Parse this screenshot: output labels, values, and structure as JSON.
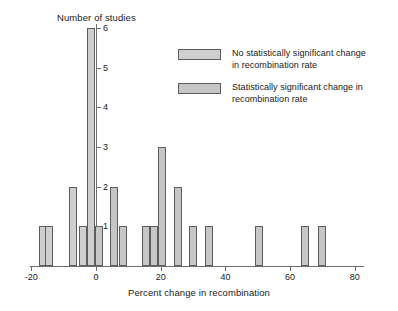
{
  "chart_data": {
    "type": "bar",
    "title": "",
    "xlabel": "Percent change in recombination",
    "ylabel": "Number of studies",
    "xlim": [
      -22,
      82
    ],
    "ylim": [
      0,
      6
    ],
    "grid": false,
    "legend_position": "upper-right",
    "xticks": [
      -20,
      0,
      20,
      40,
      60,
      80
    ],
    "xticklabels": [
      "-20",
      "0",
      "20",
      "40",
      "60",
      "80"
    ],
    "yticks": [
      1,
      2,
      3,
      4,
      5,
      6
    ],
    "yticklabels": [
      "1",
      "2",
      "3",
      "4",
      "5",
      "6"
    ],
    "series": [
      {
        "name": "No statistically significant change in recombination rate",
        "color": "#cfcfcf"
      },
      {
        "name": "Statistically significant change in recombination rate",
        "color": "#c6c6c6"
      }
    ],
    "bars": [
      {
        "x": -16.5,
        "value": 1,
        "series": 0
      },
      {
        "x": -14.5,
        "value": 1,
        "series": 0
      },
      {
        "x": -7.0,
        "value": 2,
        "series": 0
      },
      {
        "x": -4.0,
        "value": 1,
        "series": 0
      },
      {
        "x": -1.5,
        "value": 6,
        "series": 0
      },
      {
        "x": 1.0,
        "value": 1,
        "series": 1
      },
      {
        "x": 5.5,
        "value": 2,
        "series": 1
      },
      {
        "x": 8.5,
        "value": 1,
        "series": 1
      },
      {
        "x": 15.5,
        "value": 1,
        "series": 1
      },
      {
        "x": 18.0,
        "value": 1,
        "series": 1
      },
      {
        "x": 20.5,
        "value": 3,
        "series": 1
      },
      {
        "x": 25.5,
        "value": 2,
        "series": 1
      },
      {
        "x": 30.0,
        "value": 1,
        "series": 1
      },
      {
        "x": 35.0,
        "value": 1,
        "series": 1
      },
      {
        "x": 50.5,
        "value": 1,
        "series": 1
      },
      {
        "x": 64.5,
        "value": 1,
        "series": 1
      },
      {
        "x": 70.0,
        "value": 1,
        "series": 1
      }
    ]
  },
  "legend": {
    "entries": [
      {
        "line1": "No statistically significant change",
        "line2": "in recombination rate"
      },
      {
        "line1": "Statistically significant change in",
        "line2": "recombination rate"
      }
    ]
  }
}
